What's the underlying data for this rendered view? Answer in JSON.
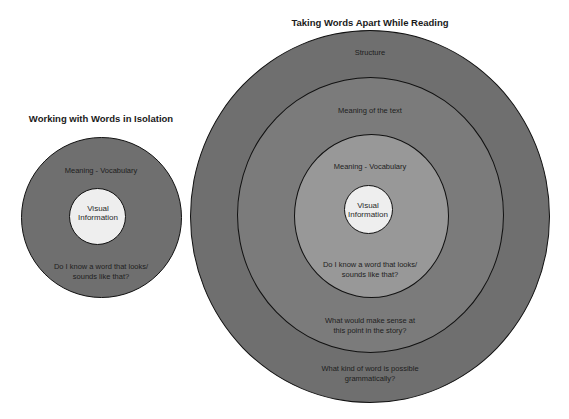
{
  "colors": {
    "outer_ring": "#6f6f6f",
    "middle_ring": "#7b7b7b",
    "vocab_ring": "#989898",
    "center": "#eeeeee",
    "outline": "#111111"
  },
  "left_diagram": {
    "title": "Working with Words in Isolation",
    "rings": {
      "outer": {
        "label_top": "Meaning - Vocabulary",
        "label_bottom_1": "Do I know a word that looks/",
        "label_bottom_2": "sounds like that?"
      },
      "center": {
        "line1": "Visual",
        "line2": "Information"
      }
    }
  },
  "right_diagram": {
    "title": "Taking Words Apart While Reading",
    "rings": {
      "structure": {
        "label_top": "Structure",
        "label_bottom_1": "What kind of word is possible",
        "label_bottom_2": "grammatically?"
      },
      "meaning_text": {
        "label_top": "Meaning of the text",
        "label_bottom_1": "What would make sense at",
        "label_bottom_2": "this point in the story?"
      },
      "vocabulary": {
        "label_top": "Meaning - Vocabulary",
        "label_bottom_1": "Do I know a word that looks/",
        "label_bottom_2": "sounds like that?"
      },
      "center": {
        "line1": "Visual",
        "line2": "Information"
      }
    }
  }
}
